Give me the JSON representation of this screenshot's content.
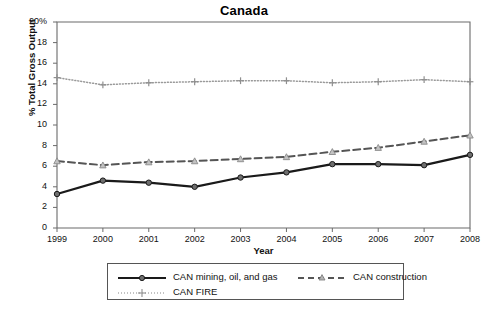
{
  "chart_data": {
    "type": "line",
    "title": "Canada",
    "xlabel": "Year",
    "ylabel": "% Total Gross Output",
    "x": [
      1999,
      2000,
      2001,
      2002,
      2003,
      2004,
      2005,
      2006,
      2007,
      2008
    ],
    "xtick_labels": [
      "1999",
      "2000",
      "2001",
      "2002",
      "2003",
      "2004",
      "2005",
      "2006",
      "2007",
      "2008"
    ],
    "ytick_labels": [
      "0",
      "2",
      "4",
      "6",
      "8",
      "10",
      "12",
      "14",
      "16",
      "18",
      "20%"
    ],
    "ytick_values": [
      0,
      2,
      4,
      6,
      8,
      10,
      12,
      14,
      16,
      18,
      20
    ],
    "ylim": [
      0,
      20
    ],
    "xlim": [
      1999,
      2008
    ],
    "grid": false,
    "legend_position": "bottom",
    "series": [
      {
        "name": "CAN mining, oil, and gas",
        "values": [
          3.3,
          4.6,
          4.4,
          4.0,
          4.9,
          5.4,
          6.2,
          6.2,
          6.1,
          7.1
        ],
        "color": "#1a1a1a",
        "style": "solid",
        "marker": "circle"
      },
      {
        "name": "CAN construction",
        "values": [
          6.5,
          6.1,
          6.4,
          6.5,
          6.7,
          6.9,
          7.4,
          7.8,
          8.4,
          9.0
        ],
        "color": "#555555",
        "style": "dashed",
        "marker": "triangle"
      },
      {
        "name": "CAN FIRE",
        "values": [
          14.6,
          13.9,
          14.1,
          14.2,
          14.3,
          14.3,
          14.1,
          14.2,
          14.4,
          14.2
        ],
        "color": "#9a9a9a",
        "style": "dotted",
        "marker": "plus"
      }
    ]
  },
  "axes": {
    "spine_color": "#6b6b6b"
  }
}
